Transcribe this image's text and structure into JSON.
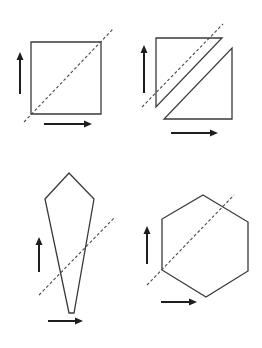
{
  "diagram": {
    "title": "",
    "colors": {
      "stroke": "#3a3a3a",
      "arrow": "#1e1e1e",
      "background": "#ffffff"
    },
    "panels": [
      {
        "id": "square",
        "shape": "square",
        "polygons": [
          [
            [
              31,
              42
            ],
            [
              101,
              42
            ],
            [
              101,
              114
            ],
            [
              31,
              114
            ]
          ]
        ],
        "cut_line": [
          [
            24,
            122
          ],
          [
            113,
            29
          ]
        ],
        "up_arrow": [
          [
            20,
            94
          ],
          [
            20,
            52
          ]
        ],
        "right_arrow": [
          [
            44,
            124
          ],
          [
            92,
            124
          ]
        ]
      },
      {
        "id": "split-square",
        "shape": "two-triangles",
        "polygons": [
          [
            [
              156,
              38
            ],
            [
              222,
              38
            ],
            [
              156,
              107
            ]
          ],
          [
            [
              232,
              48
            ],
            [
              232,
              119
            ],
            [
              164,
              119
            ]
          ]
        ],
        "cut_line": [
          [
            142,
            107
          ],
          [
            223,
            24
          ]
        ],
        "up_arrow": [
          [
            144,
            93
          ],
          [
            144,
            45
          ]
        ],
        "right_arrow": [
          [
            171,
            133
          ],
          [
            218,
            133
          ]
        ]
      },
      {
        "id": "kite",
        "shape": "kite",
        "polygons": [
          [
            [
              69,
              173
            ],
            [
              94,
              199
            ],
            [
              74,
              313
            ],
            [
              69,
              313
            ],
            [
              45,
              199
            ]
          ]
        ],
        "cut_line": [
          [
            39,
            295
          ],
          [
            115,
            217
          ]
        ],
        "up_arrow": [
          [
            39,
            272
          ],
          [
            39,
            237
          ]
        ],
        "right_arrow": [
          [
            48,
            321
          ],
          [
            83,
            321
          ]
        ]
      },
      {
        "id": "hexagon",
        "shape": "hexagon",
        "polygons": [
          [
            [
              203,
              195
            ],
            [
              248,
              222
            ],
            [
              248,
              271
            ],
            [
              206,
              297
            ],
            [
              162,
              270
            ],
            [
              162,
              219
            ]
          ]
        ],
        "cut_line": [
          [
            147,
            285
          ],
          [
            234,
            195
          ]
        ],
        "up_arrow": [
          [
            147,
            264
          ],
          [
            147,
            226
          ]
        ],
        "right_arrow": [
          [
            161,
            302
          ],
          [
            197,
            302
          ]
        ]
      }
    ]
  }
}
